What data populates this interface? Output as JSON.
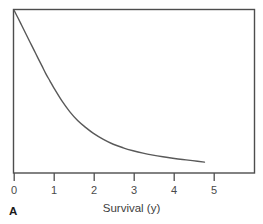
{
  "chart_data": {
    "type": "line",
    "title": "",
    "subtitle": "",
    "panel_label": "A",
    "xlabel": "Survival (y)",
    "ylabel": "",
    "xlim": [
      0,
      6.05
    ],
    "ylim": [
      0,
      1
    ],
    "xticks": [
      0,
      1,
      2,
      3,
      4,
      5
    ],
    "xtick_labels": [
      "0",
      "1",
      "2",
      "3",
      "4",
      "5"
    ],
    "yticks": [],
    "ytick_labels": [],
    "grid": false,
    "legend": null,
    "legend_position": "none",
    "annotations": [],
    "series": [
      {
        "name": "Survival curve",
        "color": "#595959",
        "line_width": 1.4,
        "x": [
          0.0,
          0.1,
          0.2,
          0.3,
          0.4,
          0.5,
          0.6,
          0.7,
          0.8,
          0.9,
          1.0,
          1.2,
          1.4,
          1.6,
          1.8,
          2.0,
          2.25,
          2.5,
          2.75,
          3.0,
          3.25,
          3.5,
          3.75,
          4.0,
          4.25,
          4.5,
          4.8
        ],
        "y": [
          1.0,
          0.952,
          0.903,
          0.854,
          0.805,
          0.756,
          0.707,
          0.659,
          0.61,
          0.567,
          0.524,
          0.445,
          0.378,
          0.323,
          0.281,
          0.244,
          0.207,
          0.177,
          0.155,
          0.137,
          0.122,
          0.11,
          0.1,
          0.091,
          0.083,
          0.076,
          0.067
        ]
      }
    ]
  },
  "figure": {
    "frame_color": "#4d4d4d",
    "background": "#ffffff",
    "tick_color": "#4d4d4d"
  }
}
